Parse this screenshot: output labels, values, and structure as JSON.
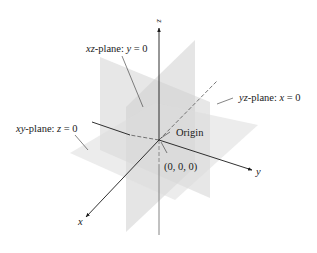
{
  "diagram": {
    "colors": {
      "background": "#ffffff",
      "axis": "#1a1a1a",
      "plane_fill": "#d9d9d9",
      "leader": "#333333"
    },
    "axes": [
      {
        "name": "x",
        "label": "x"
      },
      {
        "name": "y",
        "label": "y"
      },
      {
        "name": "z",
        "label": "z"
      }
    ],
    "planes": [
      {
        "id": "xz",
        "var_name": "xz",
        "suffix": "-plane: ",
        "eq_var": "y",
        "eq_rest": " = 0"
      },
      {
        "id": "yz",
        "var_name": "yz",
        "suffix": "-plane: ",
        "eq_var": "x",
        "eq_rest": " = 0"
      },
      {
        "id": "xy",
        "var_name": "xy",
        "suffix": "-plane: ",
        "eq_var": "z",
        "eq_rest": " = 0"
      }
    ],
    "origin": {
      "label": "Origin",
      "coordinates": "(0, 0, 0)"
    }
  }
}
